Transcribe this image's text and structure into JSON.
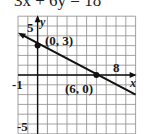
{
  "title": "3x + 6y = 18",
  "chart_data": {
    "type": "line",
    "title": "3x + 6y = 18",
    "xlabel": "x",
    "ylabel": "y",
    "xlim": [
      -2,
      10
    ],
    "ylim": [
      -6,
      6
    ],
    "grid": true,
    "tick_labels": {
      "x": [
        "-1",
        "8"
      ],
      "y": [
        "5",
        "-5"
      ]
    },
    "series": [
      {
        "name": "3x + 6y = 18",
        "x": [
          -2,
          10
        ],
        "y": [
          4,
          -2
        ]
      }
    ],
    "points": [
      {
        "label": "(0, 3)",
        "x": 0,
        "y": 3
      },
      {
        "label": "(6, 0)",
        "x": 6,
        "y": 0
      }
    ]
  }
}
